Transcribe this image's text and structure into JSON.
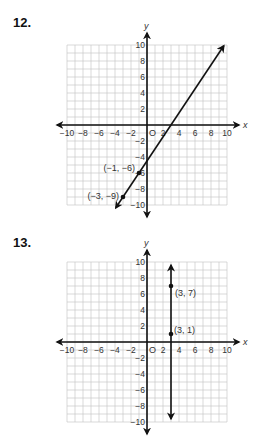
{
  "problems": [
    {
      "number": "12.",
      "points": [
        {
          "x": -1,
          "y": -6,
          "label": "(−1, −6)"
        },
        {
          "x": -3,
          "y": -9,
          "label": "(−3, −9)"
        }
      ]
    },
    {
      "number": "13.",
      "points": [
        {
          "x": 3,
          "y": 7,
          "label": "(3, 7)"
        },
        {
          "x": 3,
          "y": 1,
          "label": "(3, 1)"
        }
      ]
    }
  ],
  "axes": {
    "x_label": "x",
    "y_label": "y",
    "origin_label": "O",
    "x_ticks": [
      "−10",
      "−8",
      "−6",
      "−4",
      "−2",
      "2",
      "4",
      "6",
      "8",
      "10"
    ],
    "y_ticks": [
      "10",
      "8",
      "6",
      "4",
      "2",
      "−2",
      "−4",
      "−6",
      "−8",
      "−10"
    ]
  },
  "chart_data": [
    {
      "type": "line",
      "title": "12.",
      "xlabel": "x",
      "ylabel": "y",
      "xlim": [
        -10,
        10
      ],
      "ylim": [
        -10,
        10
      ],
      "grid": true,
      "x_tick_labels": [
        -10,
        -8,
        -6,
        -4,
        -2,
        2,
        4,
        6,
        8,
        10
      ],
      "y_tick_labels": [
        -10,
        -8,
        -6,
        -4,
        -2,
        2,
        4,
        6,
        8,
        10
      ],
      "series": [
        {
          "name": "line through (-1,-6) and (-3,-9)",
          "slope": 1.5,
          "intercept": -4.5,
          "points": [
            {
              "x": -1,
              "y": -6,
              "label": "(−1, −6)"
            },
            {
              "x": -3,
              "y": -9,
              "label": "(−3, −9)"
            }
          ]
        }
      ],
      "annotations": [
        "(−1, −6)",
        "(−3, −9)",
        "O"
      ]
    },
    {
      "type": "line",
      "title": "13.",
      "xlabel": "x",
      "ylabel": "y",
      "xlim": [
        -10,
        10
      ],
      "ylim": [
        -10,
        10
      ],
      "grid": true,
      "x_tick_labels": [
        -10,
        -8,
        -6,
        -4,
        -2,
        2,
        4,
        6,
        8,
        10
      ],
      "y_tick_labels": [
        -10,
        -8,
        -6,
        -4,
        -2,
        2,
        4,
        6,
        8,
        10
      ],
      "series": [
        {
          "name": "vertical line x = 3",
          "points": [
            {
              "x": 3,
              "y": 7,
              "label": "(3, 7)"
            },
            {
              "x": 3,
              "y": 1,
              "label": "(3, 1)"
            }
          ]
        }
      ],
      "annotations": [
        "(3, 7)",
        "(3, 1)",
        "O"
      ]
    }
  ]
}
